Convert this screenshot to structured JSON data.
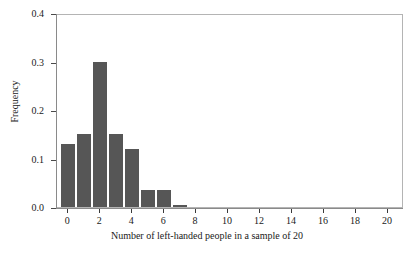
{
  "chart_data": {
    "type": "bar",
    "title": "",
    "xlabel": "Number of left-handed people in a sample of 20",
    "ylabel": "Frequency",
    "categories": [
      0,
      1,
      2,
      3,
      4,
      5,
      6,
      7,
      8,
      9,
      10,
      11,
      12,
      13,
      14,
      15,
      16,
      17,
      18,
      19,
      20
    ],
    "values": [
      0.13,
      0.15,
      0.3,
      0.15,
      0.12,
      0.035,
      0.035,
      0.005,
      0.0,
      0.0,
      0.0,
      0.0,
      0.0,
      0.0,
      0.0,
      0.0,
      0.0,
      0.0,
      0.0,
      0.0,
      0.0
    ],
    "xlim": [
      -0.7,
      21.0
    ],
    "ylim": [
      0.0,
      0.4
    ],
    "xticks": [
      0,
      2,
      4,
      6,
      8,
      10,
      12,
      14,
      16,
      18,
      20
    ],
    "xtick_labels": [
      "0",
      "2",
      "4",
      "6",
      "8",
      "10",
      "12",
      "14",
      "16",
      "18",
      "20"
    ],
    "yticks": [
      0.0,
      0.1,
      0.2,
      0.3,
      0.4
    ],
    "ytick_labels": [
      "0.0",
      "0.1",
      "0.2",
      "0.3",
      "0.4"
    ],
    "grid": false,
    "legend": null,
    "bar_color": "#565656",
    "frame_color": "#b4b4b4",
    "bar_width": 1.0
  }
}
